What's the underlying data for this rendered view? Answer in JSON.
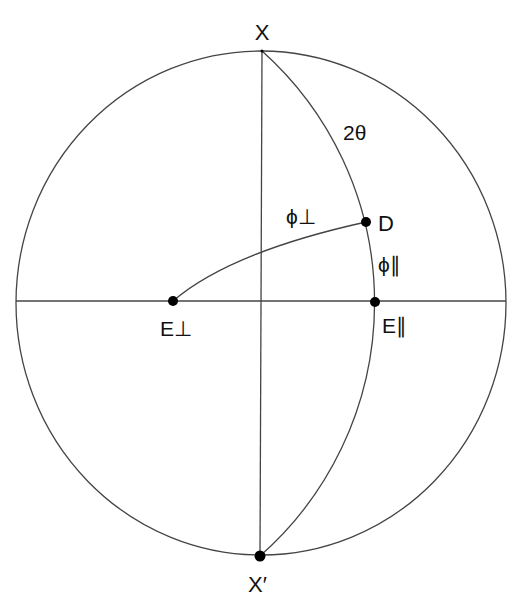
{
  "diagram": {
    "type": "stereographic projection",
    "labels": {
      "top_pole": "X",
      "bottom_pole": "X′",
      "angle_2theta": "2θ",
      "point_D": "D",
      "phi_perp": "ϕ⊥",
      "phi_parallel": "ϕ∥",
      "E_perp": "E⊥",
      "E_parallel": "E∥"
    },
    "points": [
      {
        "name": "X",
        "x": 262,
        "y": 51
      },
      {
        "name": "X'",
        "x": 260,
        "y": 556
      },
      {
        "name": "D",
        "x": 366,
        "y": 222
      },
      {
        "name": "E_perp",
        "x": 173,
        "y": 301
      },
      {
        "name": "E_parallel",
        "x": 375,
        "y": 302
      }
    ],
    "colors": {
      "line": "#444444",
      "point": "#000000",
      "text": "#111111"
    }
  }
}
